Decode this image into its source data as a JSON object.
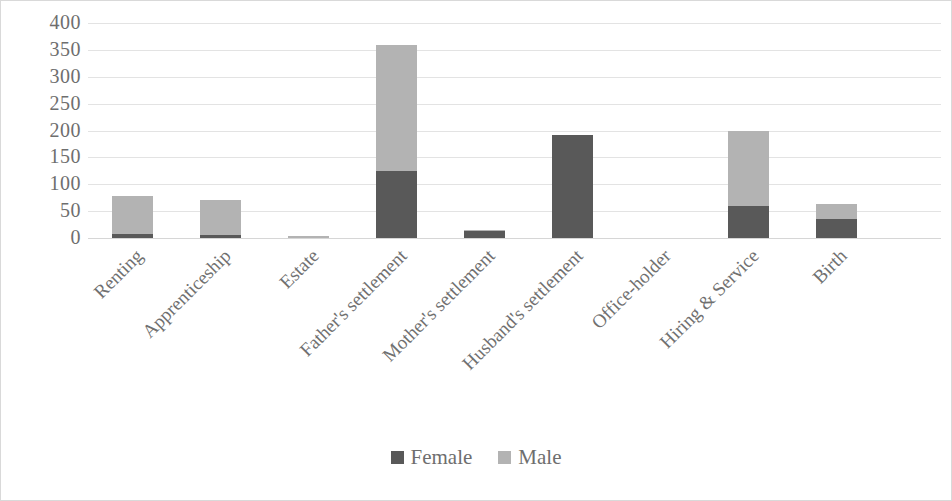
{
  "chart_data": {
    "type": "bar",
    "subtype": "stacked-vertical",
    "title": "",
    "xlabel": "",
    "ylabel": "",
    "ylim": [
      0,
      400
    ],
    "yticks": [
      400,
      350,
      300,
      250,
      200,
      150,
      100,
      50,
      0
    ],
    "grid": true,
    "legend_position": "bottom",
    "categories": [
      "Renting",
      "Apprenticeship",
      "Estate",
      "Father's settlement",
      "Mother's settlement",
      "Husband's settlement",
      "Office-holder",
      "Hiring & Service",
      "Birth"
    ],
    "series": [
      {
        "name": "Female",
        "color": "#595959",
        "values": [
          7,
          6,
          0,
          125,
          13,
          192,
          0,
          60,
          35
        ]
      },
      {
        "name": "Male",
        "color": "#b3b3b3",
        "values": [
          71,
          64,
          4,
          235,
          1,
          0,
          0,
          140,
          28
        ]
      }
    ],
    "totals": [
      78,
      70,
      4,
      360,
      14,
      192,
      0,
      200,
      63
    ]
  },
  "legend": {
    "items": [
      {
        "label": "Female",
        "color": "#595959"
      },
      {
        "label": "Male",
        "color": "#b3b3b3"
      }
    ]
  }
}
